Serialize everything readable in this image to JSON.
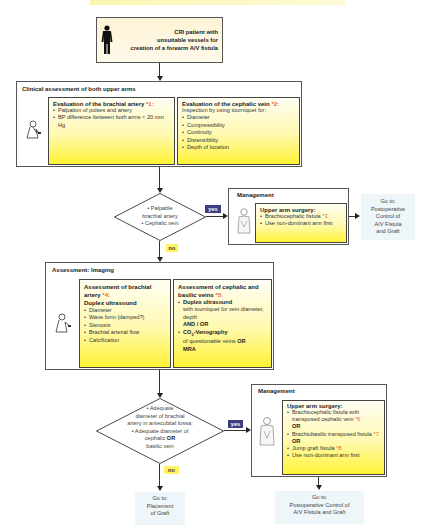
{
  "start": {
    "text_lines": [
      "CRI patient with",
      "unsuitable vessels for",
      "creation of a forearm A/V fistula"
    ],
    "icon": "standing-person-silhouette-icon"
  },
  "clinical": {
    "title": "Clinical assessment of both upper arms",
    "icon": "doctor-examining-icon",
    "brachial": {
      "heading": "Evaluation of the brachial artery",
      "ref": "*1:",
      "items": [
        "Palpation of pulses and artery",
        "BP difference between both arms < 20 mm Hg"
      ]
    },
    "cephalic": {
      "heading": "Evaluation of the cephalic vein",
      "ref": "*2:",
      "intro": "Inspection by using tourniquet for:",
      "items": [
        "Diameter",
        "Compressibility",
        "Continuity",
        "Distensibility",
        "Depth of location"
      ]
    }
  },
  "decision1": {
    "lines": [
      "• Palpable",
      "brachial artery",
      "• Cephalic vein"
    ],
    "yes": "yes",
    "no": "no"
  },
  "management1": {
    "title": "Management",
    "icon": "surgeon-icon",
    "heading": "Upper arm surgery:",
    "items": [
      {
        "text": "Brachiocephalic fistula",
        "ref": "*3"
      },
      {
        "text": "Use non-dominant arm first",
        "ref": ""
      }
    ]
  },
  "goto1": {
    "lines": [
      "Go to:",
      "Postoperative",
      "Control of",
      "A/V Fistula",
      "and Graft"
    ]
  },
  "imaging": {
    "title": "Assessment: Imaging",
    "icon": "doctor-ultrasound-icon",
    "brachial": {
      "heading": "Assessment of brachial artery",
      "ref": "*4:",
      "method": "Duplex ultrasound",
      "items": [
        "Diameter",
        "Wave form (damped?)",
        "Stenosis",
        "Brachial arterial flow",
        "Calcification"
      ]
    },
    "veins": {
      "heading": "Assessment of cephalic and basilic veins",
      "ref": "*5:",
      "item1_bold": "Duplex ultrasound",
      "item1_text": "with tourniquet for vein diameter, depth",
      "connector": "AND / OR",
      "item2_bold_pre": "CO",
      "item2_sub": "2",
      "item2_bold_post": "-Venography",
      "item2_text": "of questionable veins",
      "item2_or": "OR",
      "item2_tail": "MRA"
    }
  },
  "decision2": {
    "lines": [
      "• Adequate",
      "diameter of brachial",
      "artery in antecubital fossa;",
      "• Adequate diameter of"
    ],
    "line5_pre": "cephalic ",
    "line5_bold": "OR",
    "line6": "basilic vein",
    "yes": "yes",
    "no": "no"
  },
  "management2": {
    "title": "Management",
    "icon": "surgeon-icon",
    "heading": "Upper arm surgery:",
    "item1": "Brachiocephalic fistula with transposed cephalic vein",
    "item1_ref": "*6",
    "or1": "OR",
    "item2": "Brachiobasilic transposed fistula",
    "item2_ref": "*7",
    "or2": "OR",
    "item3": "Jump graft fistula",
    "item3_ref": "*8",
    "item4": "Use non-dominant arm first"
  },
  "goto_placement": {
    "lines": [
      "Go to:",
      "Placement",
      "of Graft"
    ]
  },
  "goto2": {
    "lines": [
      "Go to:",
      "Postoperative Control of",
      "A/V Fistula and Graft"
    ]
  },
  "colors": {
    "yellow": "#fff335",
    "ref": "#e5652f",
    "yes_bg": "#3c3f80",
    "no_bg": "#fdf363",
    "goto_bg": "#eef6fa"
  }
}
